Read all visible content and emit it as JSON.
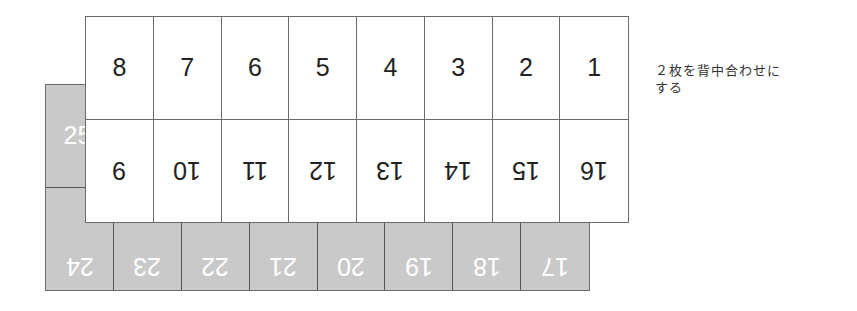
{
  "diagram": {
    "title": "",
    "note": {
      "line1": "２枚を背中合わせに",
      "line2": "する"
    },
    "front_sheet": {
      "color": "#ffffff",
      "top_row": [
        "8",
        "7",
        "6",
        "5",
        "4",
        "3",
        "2",
        "1"
      ],
      "bottom_row_upside_down": [
        "9",
        "10",
        "11",
        "12",
        "13",
        "14",
        "15",
        "16"
      ]
    },
    "back_sheet": {
      "color": "#c9c9c9",
      "top_row_visible": [
        "25"
      ],
      "bottom_row_upside_down": [
        "24",
        "23",
        "22",
        "21",
        "20",
        "19",
        "18",
        "17"
      ]
    }
  }
}
